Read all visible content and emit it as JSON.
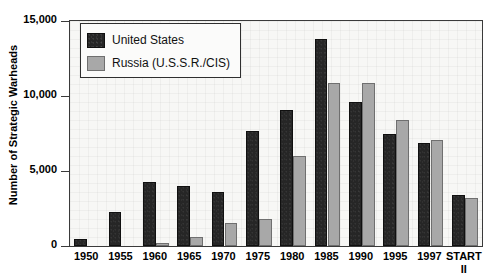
{
  "chart_data": {
    "type": "bar",
    "title": "",
    "xlabel": "",
    "ylabel": "Number of Strategic Warheads",
    "ylim": [
      0,
      15000
    ],
    "yticks": [
      0,
      5000,
      10000,
      15000
    ],
    "ytick_labels": [
      "0",
      "5,000",
      "10,000",
      "15,000"
    ],
    "grid": false,
    "legend_position": "upper-left",
    "categories": [
      "1950",
      "1955",
      "1960",
      "1965",
      "1970",
      "1975",
      "1980",
      "1985",
      "1990",
      "1995",
      "1997",
      "START II"
    ],
    "category_sublabels": [
      "",
      "",
      "",
      "",
      "",
      "",
      "",
      "",
      "",
      "",
      "",
      "II"
    ],
    "series": [
      {
        "name": "United States",
        "color": "#262626",
        "values": [
          460,
          2300,
          4300,
          4000,
          3600,
          7700,
          9100,
          13800,
          9600,
          7500,
          6900,
          3400
        ]
      },
      {
        "name": "Russia (U.S.S.R./CIS)",
        "color": "#a8a8a8",
        "values": [
          0,
          0,
          200,
          600,
          1550,
          1800,
          6000,
          10900,
          10900,
          8400,
          7050,
          3200
        ]
      }
    ]
  },
  "legend": {
    "items": [
      {
        "label": "United States",
        "swatch": "dark-swatch"
      },
      {
        "label": "Russia (U.S.S.R./CIS)",
        "swatch": "gray-swatch"
      }
    ]
  },
  "axis": {
    "y_title": "Number of Strategic Warheads"
  }
}
